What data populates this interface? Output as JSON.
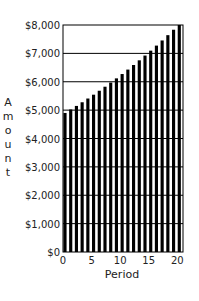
{
  "chart_data": {
    "type": "bar",
    "title": "",
    "xlabel": "Period",
    "ylabel": "Amount",
    "x": [
      0,
      1,
      2,
      3,
      4,
      5,
      6,
      7,
      8,
      9,
      10,
      11,
      12,
      13,
      14,
      15,
      16,
      17,
      18,
      19,
      20
    ],
    "values": [
      4900,
      5023,
      5148,
      5277,
      5409,
      5544,
      5683,
      5825,
      5970,
      6119,
      6272,
      6429,
      6590,
      6755,
      6923,
      7096,
      7274,
      7455,
      7642,
      7833,
      8029
    ],
    "xlim": [
      0,
      21
    ],
    "ylim": [
      0,
      8000
    ],
    "xticks": [
      0,
      5,
      10,
      15,
      20
    ],
    "xtick_labels": [
      "0",
      "5",
      "10",
      "15",
      "20"
    ],
    "yticks": [
      0,
      1000,
      2000,
      3000,
      4000,
      5000,
      6000,
      7000,
      8000
    ],
    "ytick_labels": [
      "$0",
      "$1,000",
      "$2,000",
      "$3,000",
      "$4,000",
      "$5,000",
      "$6,000",
      "$7,000",
      "$8,000"
    ],
    "grid": "horizontal",
    "legend": "none",
    "bar_color": "#000000",
    "grid_color": "#000000"
  }
}
